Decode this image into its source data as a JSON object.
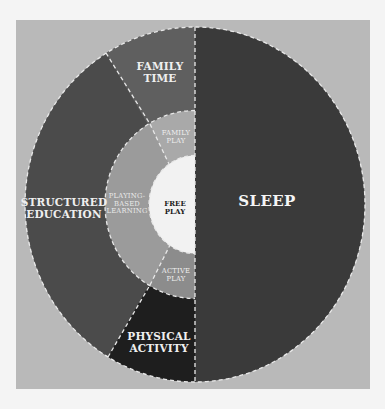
{
  "diagram": {
    "type": "nested-donut",
    "colors": {
      "background": "#f4f4f4",
      "frame": "#b9b9b9",
      "sleep": "#3a3a3a",
      "structured_education": "#4b4b4b",
      "family_time": "#5f5f5f",
      "physical_activity": "#1e1e1e",
      "playing_based_learning": "#9b9b9b",
      "family_play": "#a9a9a9",
      "active_play": "#8c8c8c",
      "free_play": "#f2f2f2",
      "divider": "#e8e8e8"
    },
    "outer_ring": [
      {
        "id": "sleep",
        "lines": [
          "SLEEP"
        ]
      },
      {
        "id": "structured_education",
        "lines": [
          "STRUCTURED",
          "EDUCATION"
        ]
      },
      {
        "id": "family_time",
        "lines": [
          "FAMILY",
          "TIME"
        ]
      },
      {
        "id": "physical_activity",
        "lines": [
          "PHYSICAL",
          "ACTIVITY"
        ]
      }
    ],
    "middle_ring": [
      {
        "id": "playing_based_learning",
        "lines": [
          "PLAYING-",
          "BASED",
          "LEARNING"
        ]
      },
      {
        "id": "family_play",
        "lines": [
          "FAMILY",
          "PLAY"
        ]
      },
      {
        "id": "active_play",
        "lines": [
          "ACTIVE",
          "PLAY"
        ]
      }
    ],
    "center": {
      "id": "free_play",
      "lines": [
        "FREE",
        "PLAY"
      ]
    }
  }
}
